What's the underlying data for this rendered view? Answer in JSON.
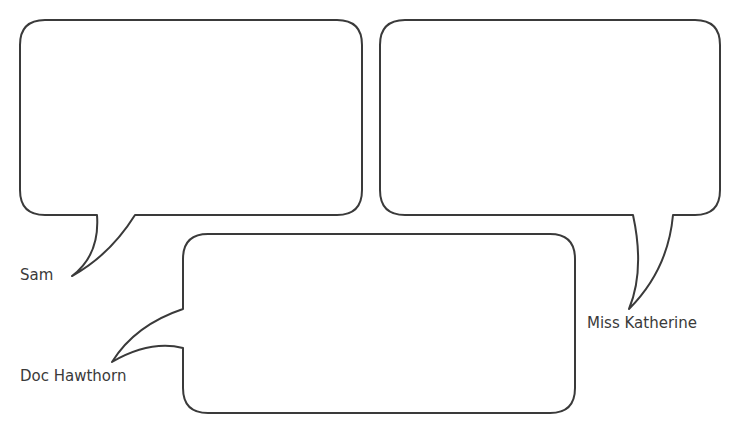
{
  "diagram": {
    "type": "speech-bubbles",
    "stroke_color": "#3a3a3a",
    "bubbles": [
      {
        "id": "sam",
        "speaker": "Sam",
        "text": ""
      },
      {
        "id": "miss-katherine",
        "speaker": "Miss Katherine",
        "text": ""
      },
      {
        "id": "doc-hawthorn",
        "speaker": "Doc Hawthorn",
        "text": ""
      }
    ]
  }
}
